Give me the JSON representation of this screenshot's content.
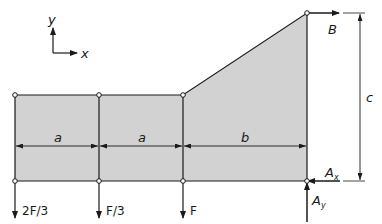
{
  "diagram": {
    "type": "structural-free-body-diagram",
    "colors": {
      "fill": "#d2d2d2",
      "stroke": "#1a1a1a",
      "background": "#ffffff"
    },
    "axes": {
      "x_label": "x",
      "y_label": "y"
    },
    "dimensions": {
      "seg1": "a",
      "seg2": "a",
      "seg3": "b",
      "height": "c"
    },
    "loads": {
      "load1": "2F/3",
      "load2": "F/3",
      "load3": "F"
    },
    "reactions": {
      "B": "B",
      "Ax": "A",
      "Ax_sub": "x",
      "Ay": "A",
      "Ay_sub": "y"
    }
  }
}
